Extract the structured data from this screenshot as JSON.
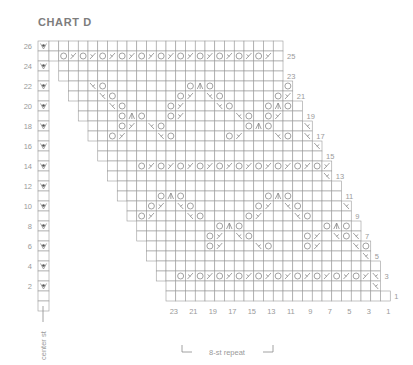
{
  "title": "CHART D",
  "center_label": "center st",
  "repeat_label": "8-st repeat",
  "left_row_labels": [
    "26",
    "24",
    "22",
    "20",
    "18",
    "16",
    "14",
    "12",
    "10",
    "8",
    "6",
    "4",
    "2"
  ],
  "right_row_labels": [
    "25",
    "23",
    "21",
    "19",
    "17",
    "15",
    "13",
    "11",
    "9",
    "7",
    "5",
    "3",
    "1"
  ],
  "column_labels": [
    "23",
    "21",
    "19",
    "17",
    "15",
    "13",
    "11",
    "9",
    "7",
    "5",
    "3",
    "1"
  ],
  "legend_symbols": {
    "o": "yarn over",
    "/": "k2tog",
    "\\": "ssk",
    "^": "central double decrease",
    "v": "center stitch marker"
  },
  "rows": [
    {
      "row": 26,
      "start": 0,
      "end": 24,
      "stitches": "........................"
    },
    {
      "row": 25,
      "start": 0,
      "end": 24,
      "stitches": ".o/o/o/o/o/o/o/o/o/o/o/."
    },
    {
      "row": 24,
      "start": 1,
      "end": 24,
      "stitches": "......................."
    },
    {
      "row": 23,
      "start": 1,
      "end": 24,
      "stitches": "......................."
    },
    {
      "row": 22,
      "start": 2,
      "end": 25,
      "stitches": "..\\o........o^o.......o."
    },
    {
      "row": 21,
      "start": 2,
      "end": 25,
      "stitches": "...\\o......o/.\\o.....o/.."
    },
    {
      "row": 20,
      "start": 3,
      "end": 26,
      "stitches": "...\\o....o/...\\o...o^o."
    },
    {
      "row": 19,
      "start": 3,
      "end": 26,
      "stitches": "....o^o..o/.....\\o.o/..\\."
    },
    {
      "row": 18,
      "start": 4,
      "end": 27,
      "stitches": "...o/.\\o........o^o...\\o"
    },
    {
      "row": 17,
      "start": 4,
      "end": 27,
      "stitches": "..o/...\\o.....o/...\\o.\\o"
    },
    {
      "row": 16,
      "start": 5,
      "end": 28,
      "stitches": "......................\\"
    },
    {
      "row": 15,
      "start": 5,
      "end": 28,
      "stitches": "......................."
    },
    {
      "row": 14,
      "start": 6,
      "end": 29,
      "stitches": "...o/o/o/o/o/o/o/o/o/o/"
    },
    {
      "row": 13,
      "start": 6,
      "end": 29,
      "stitches": "......................\\"
    },
    {
      "row": 12,
      "start": 7,
      "end": 30,
      "stitches": "......................."
    },
    {
      "row": 11,
      "start": 7,
      "end": 30,
      "stitches": "....o^o........o^o.....\\"
    },
    {
      "row": 10,
      "start": 8,
      "end": 31,
      "stitches": "..o/.\\o......o/.\\o....\\"
    },
    {
      "row": 9,
      "start": 8,
      "end": 31,
      "stitches": ".o/...\\o....o/...\\o.....\\"
    },
    {
      "row": 8,
      "start": 9,
      "end": 32,
      "stitches": "........o^o........o^o."
    },
    {
      "row": 7,
      "start": 9,
      "end": 32,
      "stitches": ".......o/.\\o.....o/.\\o\\"
    },
    {
      "row": 6,
      "start": 10,
      "end": 33,
      "stitches": "......o/...\\o...o/...\\o"
    },
    {
      "row": 5,
      "start": 10,
      "end": 33,
      "stitches": "......................\\"
    },
    {
      "row": 4,
      "start": 11,
      "end": 34,
      "stitches": "......................."
    },
    {
      "row": 3,
      "start": 11,
      "end": 34,
      "stitches": "..o/o/o/o/o/o/o/o/o/o/\\"
    },
    {
      "row": 2,
      "start": 12,
      "end": 34,
      "stitches": ".....................\\"
    },
    {
      "row": 1,
      "start": 12,
      "end": 35,
      "stitches": "......................."
    }
  ]
}
